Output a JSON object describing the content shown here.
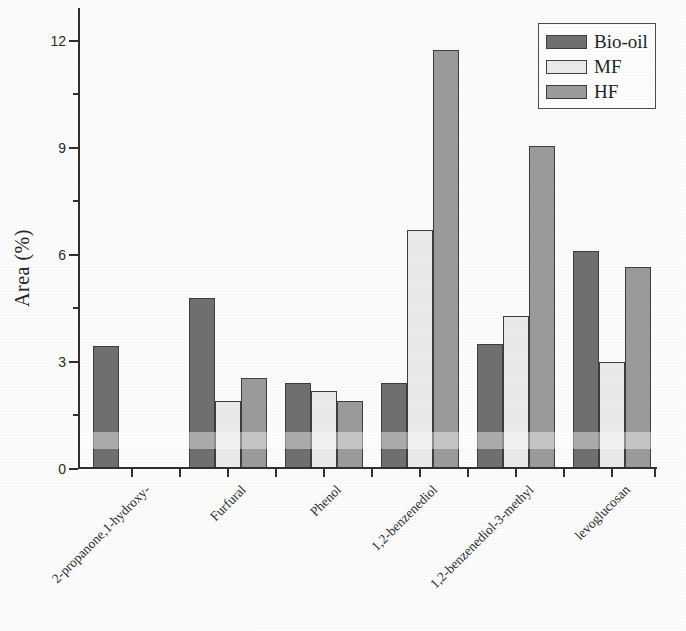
{
  "chart_data": {
    "type": "bar",
    "title": "",
    "xlabel": "",
    "ylabel": "Area (%)",
    "categories": [
      "2-propanone,1-hydroxy-",
      "Furfural",
      "Phenol",
      "1,2-benzenediol",
      "1,2-benzenediol-3-methyl",
      "levoglucosan"
    ],
    "series": [
      {
        "name": "Bio-oil",
        "color": "#6f6f6f",
        "values": [
          3.45,
          4.8,
          2.4,
          2.4,
          3.5,
          6.1
        ]
      },
      {
        "name": "MF",
        "color": "#ebebeb",
        "values": [
          0,
          1.9,
          2.2,
          6.7,
          4.3,
          3.0
        ]
      },
      {
        "name": "HF",
        "color": "#9b9b9b",
        "values": [
          0,
          2.55,
          1.9,
          11.75,
          9.05,
          5.65
        ]
      }
    ],
    "ylim": [
      0,
      12.92
    ],
    "yticks": [
      0,
      3,
      6,
      9,
      12
    ],
    "minor_yticks": [
      1.5,
      4.5,
      7.5,
      10.5
    ],
    "grid": false,
    "legend_position": "top-right",
    "bar_border_color": "#3c3c3c",
    "axis_color": "#2e2e2e",
    "text_color": "#2b2b2b"
  }
}
